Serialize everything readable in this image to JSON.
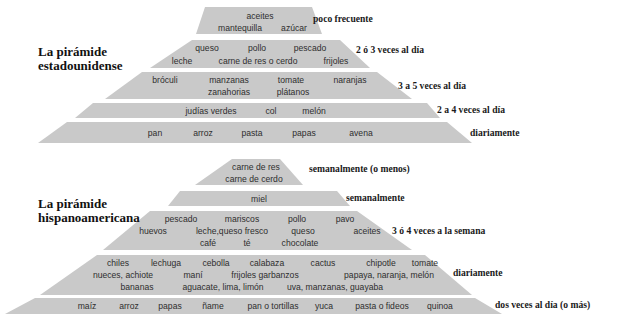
{
  "colors": {
    "tier_fill": "#c9c9c9",
    "food_text": "#2e2e2e",
    "label_text": "#1a1a1a"
  },
  "us_pyramid": {
    "title_line1": "La pirámide",
    "title_line2": "estadounidense",
    "tiers": [
      {
        "frequency": "poco frecuente",
        "foods": [
          "aceites",
          "mantequilla",
          "azúcar"
        ]
      },
      {
        "frequency": "2 ó 3 veces al día",
        "foods": [
          "queso",
          "pollo",
          "pescado",
          "leche",
          "carne de res o cerdo",
          "frijoles"
        ]
      },
      {
        "frequency": "3 a 5 veces al día",
        "foods": [
          "bróculi",
          "manzanas",
          "tomate",
          "naranjas",
          "zanahorias",
          "plátanos"
        ]
      },
      {
        "frequency": "2 a 4 veces al día",
        "foods": [
          "judías verdes",
          "col",
          "melón"
        ]
      },
      {
        "frequency": "diariamente",
        "foods": [
          "pan",
          "arroz",
          "pasta",
          "papas",
          "avena"
        ]
      }
    ]
  },
  "hispanic_pyramid": {
    "title_line1": "La pirámide",
    "title_line2": "hispanoamericana",
    "tiers": [
      {
        "frequency": "semanalmente (o menos)",
        "foods": [
          "carne de res",
          "carne de cerdo"
        ]
      },
      {
        "frequency": "semanalmente",
        "foods": [
          "miel"
        ]
      },
      {
        "frequency": "3 ó 4 veces a la semana",
        "foods": [
          "pescado",
          "mariscos",
          "pollo",
          "pavo",
          "huevos",
          "leche,queso fresco",
          "queso",
          "aceites",
          "café",
          "té",
          "chocolate"
        ]
      },
      {
        "frequency": "diariamente",
        "foods": [
          "chiles",
          "lechuga",
          "cebolla",
          "calabaza",
          "cactus",
          "chipotle",
          "tomate",
          "nueces, achiote",
          "maní",
          "frijoles garbanzos",
          "papaya, naranja, melón",
          "bananas",
          "aguacate, lima, limón",
          "uva, manzanas, guayaba"
        ]
      },
      {
        "frequency": "dos veces al día (o más)",
        "foods": [
          "maíz",
          "arroz",
          "papas",
          "ñame",
          "pan o tortillas",
          "yuca",
          "pasta o fideos",
          "quinoa"
        ]
      }
    ]
  }
}
